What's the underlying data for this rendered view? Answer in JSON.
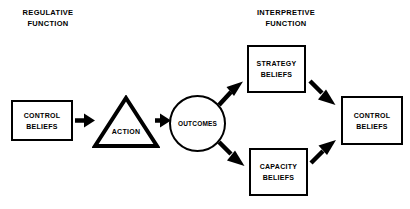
{
  "diagram": {
    "title_regulative": "REGULATIVE\nFUNCTION",
    "title_interpretive": "INTERPRETIVE\nFUNCTION",
    "nodes": {
      "control_beliefs_left": {
        "line1": "CONTROL",
        "line2": "BELIEFS"
      },
      "action": {
        "label": "ACTION"
      },
      "outcomes": {
        "label": "OUTCOMES"
      },
      "strategy_beliefs": {
        "line1": "STRATEGY",
        "line2": "BELIEFS"
      },
      "capacity_beliefs": {
        "line1": "CAPACITY",
        "line2": "BELIEFS"
      },
      "control_beliefs_right": {
        "line1": "CONTROL",
        "line2": "BELIEFS"
      }
    },
    "colors": {
      "stroke": "#000000",
      "fill": "#ffffff",
      "background": "#ffffff"
    }
  }
}
